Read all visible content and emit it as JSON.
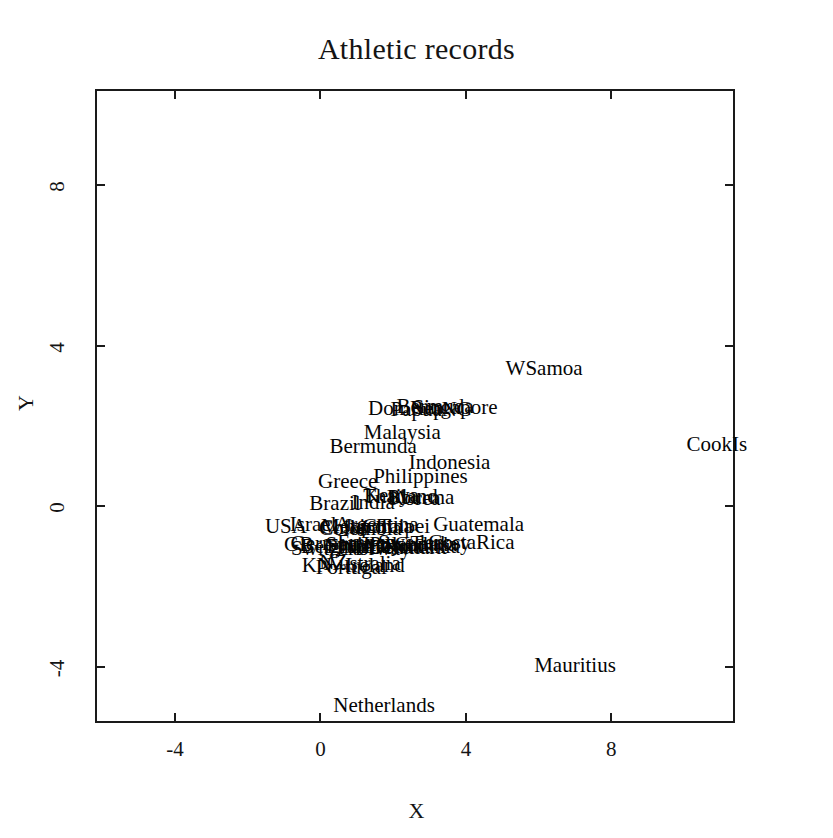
{
  "chart_data": {
    "type": "scatter",
    "title": "Athletic records",
    "xlabel": "X",
    "ylabel": "Y",
    "xlim": [
      -6.2,
      11.4
    ],
    "ylim": [
      -5.4,
      10.4
    ],
    "xticks": [
      -4,
      0,
      4,
      8
    ],
    "yticks": [
      -4,
      0,
      4,
      8
    ],
    "xtick_labels": [
      "-4",
      "0",
      "4",
      "8"
    ],
    "ytick_labels": [
      "-4",
      "0",
      "4",
      "8"
    ],
    "grid": false,
    "legend": null,
    "marker_style": "text-label-only",
    "points": [
      {
        "label": "WSamoa",
        "x": 6.15,
        "y": 3.45
      },
      {
        "label": "CookIs",
        "x": 10.9,
        "y": 1.55
      },
      {
        "label": "Mauritius",
        "x": 7.0,
        "y": -3.95
      },
      {
        "label": "Netherlands",
        "x": 1.75,
        "y": -4.95
      },
      {
        "label": "DomRep",
        "x": 2.35,
        "y": 2.45
      },
      {
        "label": "Singapore",
        "x": 3.7,
        "y": 2.48
      },
      {
        "label": "Bermuda",
        "x": 3.15,
        "y": 2.5
      },
      {
        "label": "PapuaNG",
        "x": 3.05,
        "y": 2.42
      },
      {
        "label": "Malaysia",
        "x": 2.25,
        "y": 1.85
      },
      {
        "label": "Bermunda",
        "x": 1.45,
        "y": 1.5
      },
      {
        "label": "Indonesia",
        "x": 3.55,
        "y": 1.1
      },
      {
        "label": "Philippines",
        "x": 2.75,
        "y": 0.75
      },
      {
        "label": "Greece",
        "x": 0.75,
        "y": 0.62
      },
      {
        "label": "Bburma",
        "x": 2.75,
        "y": 0.22
      },
      {
        "label": "Korea",
        "x": 2.6,
        "y": 0.2
      },
      {
        "label": "Kenya",
        "x": 1.95,
        "y": 0.28
      },
      {
        "label": "Thailand",
        "x": 2.2,
        "y": 0.25
      },
      {
        "label": "Brazil",
        "x": 0.4,
        "y": 0.08
      },
      {
        "label": "India",
        "x": 1.45,
        "y": 0.1
      },
      {
        "label": "Guatemala",
        "x": 4.35,
        "y": -0.45
      },
      {
        "label": "CostaRica",
        "x": 4.15,
        "y": -0.9
      },
      {
        "label": "Argentina",
        "x": 1.55,
        "y": -0.45
      },
      {
        "label": "USA",
        "x": -0.95,
        "y": -0.5
      },
      {
        "label": "Israel",
        "x": -0.2,
        "y": -0.45
      },
      {
        "label": "Mexico",
        "x": 0.9,
        "y": -0.5
      },
      {
        "label": "Colombia",
        "x": 1.1,
        "y": -0.55
      },
      {
        "label": "Chile",
        "x": 0.6,
        "y": -0.52
      },
      {
        "label": "Japan",
        "x": 1.3,
        "y": -0.48
      },
      {
        "label": "China",
        "x": 1.85,
        "y": -0.5
      },
      {
        "label": "Taipei",
        "x": 2.3,
        "y": -0.48
      },
      {
        "label": "GB",
        "x": -0.6,
        "y": -0.95
      },
      {
        "label": "Germany",
        "x": 0.25,
        "y": -0.92
      },
      {
        "label": "Spain",
        "x": 0.8,
        "y": -0.95
      },
      {
        "label": "France",
        "x": 1.25,
        "y": -0.9
      },
      {
        "label": "Italy",
        "x": 1.7,
        "y": -0.93
      },
      {
        "label": "Poland",
        "x": 2.15,
        "y": -0.95
      },
      {
        "label": "Sweden",
        "x": 2.5,
        "y": -0.9
      },
      {
        "label": "Canada",
        "x": 2.9,
        "y": -0.95
      },
      {
        "label": "Turkey",
        "x": 3.3,
        "y": -0.92
      },
      {
        "label": "Finland",
        "x": 1.05,
        "y": -1.0
      },
      {
        "label": "Norway",
        "x": 1.55,
        "y": -1.05
      },
      {
        "label": "Belgium",
        "x": 0.45,
        "y": -1.0
      },
      {
        "label": "Austria",
        "x": 1.95,
        "y": -1.0
      },
      {
        "label": "Denmark",
        "x": 2.4,
        "y": -1.02
      },
      {
        "label": "Romania",
        "x": 2.8,
        "y": -0.98
      },
      {
        "label": "Switzerl",
        "x": 0.15,
        "y": -1.05
      },
      {
        "label": "KN",
        "x": -0.1,
        "y": -1.45
      },
      {
        "label": "Portugal",
        "x": 0.85,
        "y": -1.5
      },
      {
        "label": "Ireland",
        "x": 1.5,
        "y": -1.45
      },
      {
        "label": "NZ",
        "x": 0.35,
        "y": -1.4
      },
      {
        "label": "Australia",
        "x": 1.15,
        "y": -1.42
      }
    ]
  }
}
